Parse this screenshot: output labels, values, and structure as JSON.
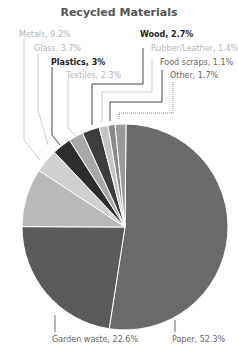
{
  "chart_data": {
    "type": "pie",
    "title": "Recycled Materials",
    "categories": [
      "Paper",
      "Garden waste",
      "Metals",
      "Glass",
      "Plastics",
      "Textiles",
      "Wood",
      "Rubber/Leather",
      "Food scraps",
      "Other"
    ],
    "values": [
      52.3,
      22.6,
      9.2,
      3.7,
      3.0,
      2.3,
      2.7,
      1.4,
      1.1,
      1.7
    ],
    "unit": "%",
    "legend": "leader-line labels"
  },
  "labels": {
    "metals": "Metals, 9.2%",
    "glass": "Glass, 3.7%",
    "plastics": "Plastics, 3%",
    "textiles": "Textiles, 2.3%",
    "wood": "Wood, 2.7%",
    "rubber": "Rubber/Leather, 1.4%",
    "food": "Food scraps, 1.1%",
    "other": "Other, 1.7%",
    "garden": "Garden waste, 22.6%",
    "paper": "Paper, 52.3%"
  }
}
